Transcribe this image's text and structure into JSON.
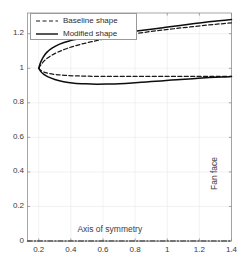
{
  "chart_data": {
    "type": "line",
    "title": "",
    "xlabel": "",
    "ylabel": "",
    "xlim": [
      0.13,
      1.4
    ],
    "ylim": [
      0.0,
      1.32
    ],
    "xticks": [
      0.2,
      0.4,
      0.6,
      0.8,
      1,
      1.2,
      1.4
    ],
    "xticklabels": [
      "0.2",
      "0.4",
      "0.6",
      "0.8",
      "1",
      "1.2",
      "1.4"
    ],
    "yticks": [
      0,
      0.2,
      0.4,
      0.6,
      0.8,
      1,
      1.2
    ],
    "yticklabels": [
      "0",
      "0.2",
      "0.4",
      "0.6",
      "0.8",
      "1",
      "1.2"
    ],
    "grid": true,
    "grid_color": "#ededed",
    "legend_position": "top-left",
    "series": [
      {
        "name": "Baseline shape",
        "style": "dashed",
        "color": "#1a1a1a",
        "branches": [
          {
            "name": "upper-surface",
            "x": [
              0.2,
              0.215,
              0.24,
              0.275,
              0.32,
              0.38,
              0.45,
              0.53,
              0.62,
              0.71,
              0.8,
              0.89,
              0.98,
              1.07,
              1.16,
              1.25,
              1.33,
              1.4
            ],
            "y": [
              1.0,
              1.022,
              1.048,
              1.072,
              1.094,
              1.116,
              1.136,
              1.154,
              1.172,
              1.187,
              1.2,
              1.212,
              1.222,
              1.232,
              1.241,
              1.25,
              1.257,
              1.263
            ]
          },
          {
            "name": "lower-surface",
            "x": [
              0.2,
              0.212,
              0.232,
              0.262,
              0.305,
              0.36,
              0.43,
              0.51,
              0.6,
              0.7,
              0.8,
              0.9,
              1.0,
              1.1,
              1.2,
              1.3,
              1.4
            ],
            "y": [
              1.0,
              0.988,
              0.978,
              0.97,
              0.964,
              0.959,
              0.956,
              0.954,
              0.953,
              0.953,
              0.953,
              0.953,
              0.953,
              0.953,
              0.953,
              0.953,
              0.953
            ]
          }
        ]
      },
      {
        "name": "Modified shape",
        "style": "solid",
        "color": "#0d0d0d",
        "branches": [
          {
            "name": "upper-surface",
            "x": [
              0.2,
              0.21,
              0.226,
              0.25,
              0.285,
              0.33,
              0.39,
              0.46,
              0.54,
              0.63,
              0.72,
              0.81,
              0.9,
              0.99,
              1.08,
              1.17,
              1.26,
              1.34,
              1.4
            ],
            "y": [
              1.0,
              1.03,
              1.062,
              1.092,
              1.118,
              1.14,
              1.158,
              1.172,
              1.185,
              1.196,
              1.206,
              1.216,
              1.226,
              1.237,
              1.248,
              1.259,
              1.269,
              1.277,
              1.282
            ]
          },
          {
            "name": "lower-surface",
            "x": [
              0.2,
              0.212,
              0.23,
              0.258,
              0.3,
              0.355,
              0.42,
              0.49,
              0.56,
              0.63,
              0.7,
              0.78,
              0.87,
              0.96,
              1.06,
              1.16,
              1.26,
              1.34,
              1.4
            ],
            "y": [
              1.0,
              0.982,
              0.966,
              0.95,
              0.935,
              0.922,
              0.914,
              0.91,
              0.908,
              0.909,
              0.911,
              0.915,
              0.921,
              0.927,
              0.934,
              0.94,
              0.946,
              0.95,
              0.952
            ]
          }
        ]
      },
      {
        "name": "Axis of symmetry line",
        "style": "dash-dot",
        "color": "#1a1a1a",
        "branches": [
          {
            "name": "symmetry-axis",
            "x": [
              0.13,
              1.4
            ],
            "y": [
              0.0,
              0.0
            ]
          }
        ]
      }
    ],
    "annotations": [
      {
        "name": "axis-of-symmetry",
        "text": "Axis of symmetry",
        "x": 0.69,
        "y": 0.065,
        "rotation": 0
      },
      {
        "name": "fan-face",
        "text": "Fan face",
        "x": 1.345,
        "y": 0.46,
        "rotation": -90
      }
    ]
  },
  "legend": {
    "items": [
      {
        "label": "Baseline shape",
        "style": "dashed"
      },
      {
        "label": "Modified shape",
        "style": "solid"
      }
    ]
  }
}
